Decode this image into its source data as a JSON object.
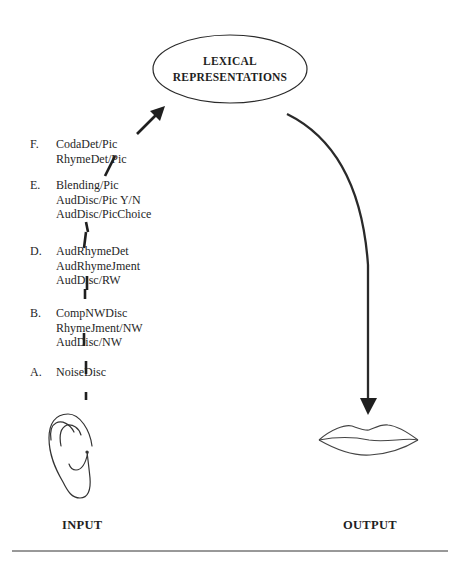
{
  "diagram": {
    "central_node": {
      "line1": "LEXICAL",
      "line2": "REPRESENTATIONS",
      "shape": "ellipse"
    },
    "stages": [
      {
        "letter": "F.",
        "items": [
          "CodaDet/Pic",
          "RhymeDet/Pic"
        ]
      },
      {
        "letter": "E.",
        "items": [
          "Blending/Pic",
          "AudDisc/Pic Y/N",
          "AudDisc/PicChoice"
        ]
      },
      {
        "letter": "D.",
        "items": [
          "AudRhymeDet",
          "AudRhymeJment",
          "AudDisc/RW"
        ]
      },
      {
        "letter": "B.",
        "items": [
          "CompNWDisc",
          "RhymeJment/NW",
          "AudDisc/NW"
        ]
      },
      {
        "letter": "A.",
        "items": [
          "NoiseDisc"
        ]
      }
    ],
    "input": {
      "label": "INPUT",
      "icon": "ear-icon"
    },
    "output": {
      "label": "OUTPUT",
      "icon": "lips-icon"
    },
    "edges": [
      {
        "from": "ear-icon",
        "to": "LEXICAL REPRESENTATIONS",
        "style": "dashed-with-arrow"
      },
      {
        "from": "LEXICAL REPRESENTATIONS",
        "to": "lips-icon",
        "style": "curved-solid-arrow"
      }
    ],
    "colors": {
      "ink": "#1f1f1f",
      "background": "#ffffff"
    }
  }
}
